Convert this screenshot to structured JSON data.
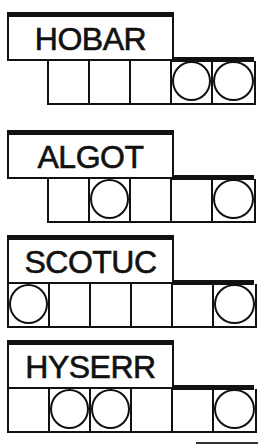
{
  "game": {
    "type": "word-scramble-jumble",
    "cell_width": 41,
    "puzzles": [
      {
        "scrambled": "HOBAR",
        "cell_count": 5,
        "cell_offset": 1,
        "circled_indices": [
          3,
          4
        ],
        "top": 12
      },
      {
        "scrambled": "ALGOT",
        "cell_count": 5,
        "cell_offset": 1,
        "circled_indices": [
          1,
          4
        ],
        "top": 130
      },
      {
        "scrambled": "SCOTUC",
        "cell_count": 6,
        "cell_offset": 0,
        "circled_indices": [
          0,
          5
        ],
        "top": 235
      },
      {
        "scrambled": "HYSERR",
        "cell_count": 6,
        "cell_offset": 0,
        "circled_indices": [
          1,
          2,
          5
        ],
        "top": 340
      }
    ]
  },
  "colors": {
    "ink": "#111111",
    "paper": "#ffffff"
  }
}
